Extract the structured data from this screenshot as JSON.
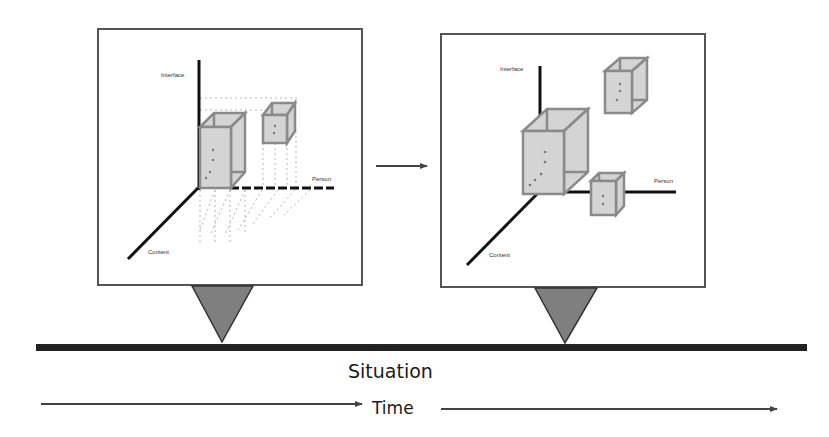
{
  "colors": {
    "axis": "#111111",
    "cube_fill": "#d4d4d4",
    "cube_edge": "#8a8a8a",
    "triangle_fill": "#7f7f7f",
    "frame": "#555555",
    "timeline": "#222222",
    "arrow": "#444444"
  },
  "panels": [
    {
      "id": "before",
      "axis_labels": {
        "interface": "Interface",
        "person": "Person",
        "content": "Content"
      }
    },
    {
      "id": "after",
      "axis_labels": {
        "interface": "Interface",
        "person": "Person",
        "content": "Content"
      }
    }
  ],
  "timeline": {
    "label": "Situation"
  },
  "time_axis": {
    "label": "Time"
  }
}
